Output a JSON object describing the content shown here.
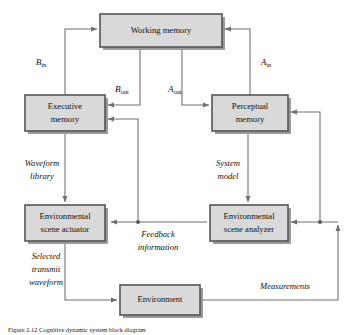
{
  "figure": {
    "title": "Cognitive dynamic system block diagram",
    "background_color": "#ffffff",
    "box_fill": "#d9d9d9",
    "box_stroke": "#555555",
    "wire_color": "#6f6f6f"
  },
  "blocks": {
    "working_memory": {
      "label": "Working memory",
      "x": 100,
      "y": 14,
      "w": 122,
      "h": 33
    },
    "executive_memory": {
      "line1": "Executive",
      "line2": "memory",
      "x": 25,
      "y": 95,
      "w": 80,
      "h": 36
    },
    "perceptual_memory": {
      "line1": "Perceptual",
      "line2": "memory",
      "x": 212,
      "y": 95,
      "w": 76,
      "h": 36
    },
    "scene_actuator": {
      "line1": "Environmental",
      "line2": "scene actuator",
      "x": 25,
      "y": 205,
      "w": 80,
      "h": 36
    },
    "scene_analyzer": {
      "line1": "Environmental",
      "line2": "scene analyzer",
      "x": 210,
      "y": 205,
      "w": 78,
      "h": 36
    },
    "environment": {
      "label": "Environment",
      "x": 120,
      "y": 285,
      "w": 80,
      "h": 30
    }
  },
  "signal_labels": {
    "b_in": {
      "base": "B",
      "sub": "in",
      "x": 41,
      "y": 62
    },
    "b_out": {
      "base": "B",
      "sub": "out",
      "x": 122,
      "y": 89
    },
    "a_out": {
      "base": "A",
      "sub": "out",
      "x": 175,
      "y": 89
    },
    "a_in": {
      "base": "A",
      "sub": "in",
      "x": 266,
      "y": 62
    }
  },
  "annotations": {
    "waveform_library": {
      "line1": "Waveform",
      "line2": "library",
      "x": 42,
      "y": 164
    },
    "system_model": {
      "line1": "System",
      "line2": "model",
      "x": 228,
      "y": 164
    },
    "feedback_information": {
      "line1": "Feedback",
      "line2": "information",
      "x": 158,
      "y": 244
    },
    "selected_transmit_waveform": {
      "line1": "Selected",
      "line2": "transmit",
      "line3": "waveform",
      "x": 46,
      "y": 256
    },
    "measurements": {
      "label": "Measurements",
      "x": 285,
      "y": 286
    }
  },
  "caption": {
    "text": "Figure 2.12  Cognitive dynamic system block diagram"
  }
}
